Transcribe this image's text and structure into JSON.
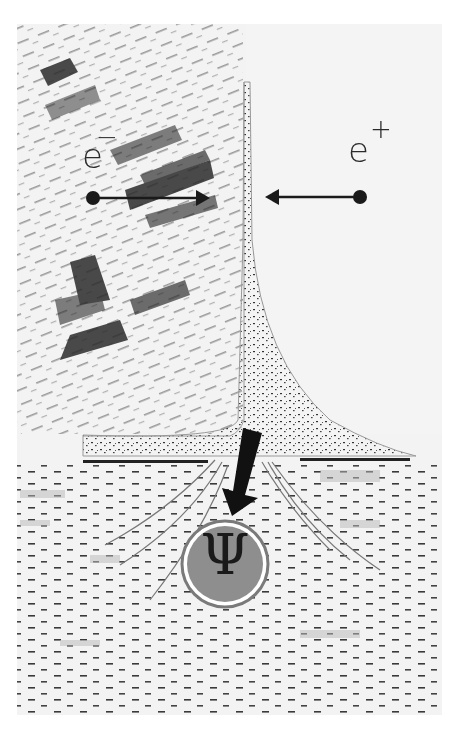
{
  "illustration": {
    "subject": "electron-positron annihilation producing psi particle",
    "labels": {
      "electron": {
        "base": "e",
        "charge": "−"
      },
      "positron": {
        "base": "e",
        "charge": "+"
      },
      "particle": "Ψ"
    },
    "colors": {
      "background": "#ffffff",
      "paper": "#f1f1f1",
      "ink": "#1c1c1c",
      "circle_fill": "#8a8a8a",
      "circle_ring": "#777777",
      "wash": "#b9b9b9"
    }
  }
}
